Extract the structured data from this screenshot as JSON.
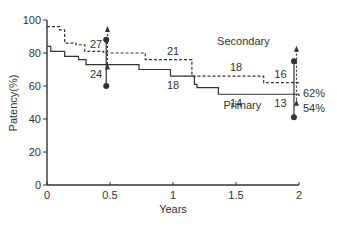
{
  "chart_data": {
    "type": "line",
    "title": "",
    "xlabel": "Years",
    "ylabel": "Patency(%)",
    "xlim": [
      0,
      2
    ],
    "ylim": [
      0,
      100
    ],
    "x_ticks": [
      "0",
      "0.5",
      "1",
      "1.5",
      "2"
    ],
    "y_ticks": [
      "0",
      "20",
      "40",
      "60",
      "80",
      "100"
    ],
    "grid": false,
    "series": [
      {
        "name": "Secondary",
        "style": "dashed",
        "step": true,
        "points": [
          [
            0,
            96
          ],
          [
            0.1,
            94
          ],
          [
            0.14,
            86
          ],
          [
            0.23,
            85
          ],
          [
            0.3,
            81
          ],
          [
            0.45,
            80
          ],
          [
            0.78,
            76
          ],
          [
            1.15,
            66
          ],
          [
            1.72,
            62
          ],
          [
            2,
            62
          ]
        ],
        "end_label": "62%",
        "at_risk": [
          {
            "x": 0.5,
            "n": "27"
          },
          {
            "x": 1.0,
            "n": "21"
          },
          {
            "x": 1.5,
            "n": "18"
          },
          {
            "x": 1.9,
            "n": "16"
          }
        ],
        "error_bars": [
          {
            "x": 0.48,
            "high": 94,
            "low": 70
          },
          {
            "x": 1.98,
            "high": 82,
            "low": 48
          }
        ]
      },
      {
        "name": "Primary",
        "style": "solid",
        "step": true,
        "points": [
          [
            0,
            84
          ],
          [
            0.03,
            81
          ],
          [
            0.14,
            78
          ],
          [
            0.25,
            76
          ],
          [
            0.31,
            73
          ],
          [
            0.73,
            70
          ],
          [
            0.98,
            66
          ],
          [
            1.17,
            61
          ],
          [
            1.19,
            59
          ],
          [
            1.36,
            55
          ],
          [
            2,
            54
          ]
        ],
        "end_label": "54%",
        "at_risk": [
          {
            "x": 0.5,
            "n": "24"
          },
          {
            "x": 1.0,
            "n": "18"
          },
          {
            "x": 1.5,
            "n": "14"
          },
          {
            "x": 1.9,
            "n": "13"
          }
        ],
        "error_bars": [
          {
            "x": 0.47,
            "high": 88,
            "low": 60
          },
          {
            "x": 1.96,
            "high": 75,
            "low": 41
          }
        ]
      }
    ],
    "annotations": [
      {
        "text": "Secondary",
        "x": 1.35,
        "y": 85
      },
      {
        "text": "Primary",
        "x": 1.4,
        "y": 46
      }
    ]
  }
}
